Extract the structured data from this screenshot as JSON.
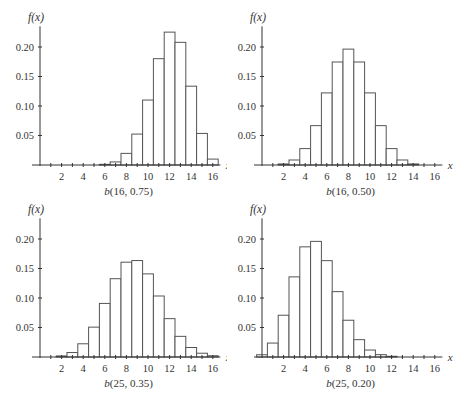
{
  "figure": {
    "y_axis_label": "f(x)",
    "x_axis_label": "x",
    "y_ticks": [
      "0.05",
      "0.10",
      "0.15",
      "0.20"
    ],
    "x_ticks": [
      "2",
      "4",
      "6",
      "8",
      "10",
      "12",
      "14",
      "16"
    ]
  },
  "chart_data": [
    {
      "type": "bar",
      "title": "b(16, 0.75)",
      "xlabel": "x",
      "ylabel": "f(x)",
      "ylim": [
        0,
        0.23
      ],
      "xlim": [
        0,
        16.5
      ],
      "grid": false,
      "categories": [
        0,
        1,
        2,
        3,
        4,
        5,
        6,
        7,
        8,
        9,
        10,
        11,
        12,
        13,
        14,
        15,
        16
      ],
      "values": [
        0,
        0,
        0,
        0,
        0,
        0.0002,
        0.0011,
        0.0052,
        0.0197,
        0.0524,
        0.1101,
        0.1802,
        0.2252,
        0.2079,
        0.1336,
        0.0535,
        0.01
      ]
    },
    {
      "type": "bar",
      "title": "b(16, 0.50)",
      "xlabel": "x",
      "ylabel": "f(x)",
      "ylim": [
        0,
        0.23
      ],
      "xlim": [
        0,
        16.5
      ],
      "grid": false,
      "categories": [
        0,
        1,
        2,
        3,
        4,
        5,
        6,
        7,
        8,
        9,
        10,
        11,
        12,
        13,
        14,
        15,
        16
      ],
      "values": [
        0,
        0.0002,
        0.0018,
        0.0085,
        0.0278,
        0.0667,
        0.1222,
        0.1746,
        0.1964,
        0.1746,
        0.1222,
        0.0667,
        0.0278,
        0.0085,
        0.0018,
        0.0002,
        0
      ]
    },
    {
      "type": "bar",
      "title": "b(25, 0.35)",
      "xlabel": "x",
      "ylabel": "f(x)",
      "ylim": [
        0,
        0.23
      ],
      "xlim": [
        0,
        16.5
      ],
      "grid": false,
      "categories": [
        0,
        1,
        2,
        3,
        4,
        5,
        6,
        7,
        8,
        9,
        10,
        11,
        12,
        13,
        14,
        15,
        16
      ],
      "values": [
        0,
        0.0003,
        0.0018,
        0.0076,
        0.0224,
        0.0506,
        0.0908,
        0.1327,
        0.1607,
        0.1635,
        0.1409,
        0.1034,
        0.065,
        0.035,
        0.0161,
        0.0064,
        0.0021
      ]
    },
    {
      "type": "bar",
      "title": "b(25, 0.20)",
      "xlabel": "x",
      "ylabel": "f(x)",
      "ylim": [
        0,
        0.23
      ],
      "xlim": [
        0,
        16.5
      ],
      "grid": false,
      "categories": [
        0,
        1,
        2,
        3,
        4,
        5,
        6,
        7,
        8,
        9,
        10,
        11,
        12,
        13,
        14,
        15,
        16
      ],
      "values": [
        0.0038,
        0.0236,
        0.0708,
        0.1358,
        0.1867,
        0.196,
        0.1633,
        0.1108,
        0.0623,
        0.0294,
        0.0118,
        0.004,
        0.0012,
        0.0003,
        0.0001,
        0,
        0
      ]
    }
  ]
}
